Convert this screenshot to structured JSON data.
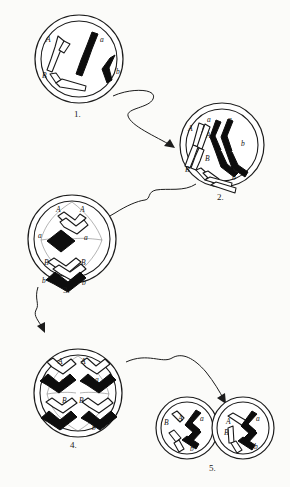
{
  "figure": {
    "background_color": "#fbfbf9",
    "ink_color": "#1a1a1a",
    "maternal_chromosome_color": "#ffffff",
    "paternal_chromosome_color": "#0d0d0d"
  },
  "stages": [
    {
      "caption": "1.",
      "name": "interphase-single-chromosomes",
      "chromosome_labels": [
        "A",
        "a",
        "B",
        "b"
      ],
      "labels": {
        "A": "A",
        "a": "a",
        "B": "B",
        "b": "b"
      }
    },
    {
      "caption": "2.",
      "name": "prophase-duplicated-chromosomes",
      "chromosome_labels": [
        "A",
        "a",
        "a",
        "A",
        "B",
        "B",
        "b",
        "b"
      ],
      "labels": {
        "A_left": "A",
        "A_mid": "A",
        "a_top_left": "a",
        "a_top_right": "a",
        "B_left": "B",
        "B_mid": "B",
        "b_right": "b",
        "b_low": "b"
      }
    },
    {
      "caption": "3.",
      "name": "metaphase-alignment",
      "chromosome_labels": [
        "A",
        "A",
        "a",
        "a",
        "B",
        "B",
        "b",
        "b"
      ],
      "labels": {
        "A_left": "A",
        "A_right": "A",
        "a_left": "a",
        "a_right": "a",
        "B_left": "B",
        "B_right": "B",
        "b_left": "b",
        "b_right": "b"
      }
    },
    {
      "caption": "4.",
      "name": "anaphase-separation",
      "chromosome_labels": [
        "A",
        "A",
        "a",
        "a",
        "B",
        "B",
        "b",
        "b"
      ],
      "labels": {
        "A_left": "A",
        "A_right": "A",
        "a_left": "a",
        "a_right": "a",
        "B_left": "B",
        "B_right": "B",
        "b_left": "b",
        "b_right": "b"
      }
    },
    {
      "caption": "5.",
      "name": "telophase-two-daughter-cells",
      "daughter_cells": [
        {
          "name": "left-daughter-cell",
          "labels": [
            "B",
            "A",
            "a",
            "b"
          ]
        },
        {
          "name": "right-daughter-cell",
          "labels": [
            "A",
            "B",
            "a",
            "b"
          ]
        }
      ],
      "labels": {
        "left_B": "B",
        "left_A": "A",
        "left_a": "a",
        "left_b": "b",
        "right_A": "A",
        "right_B": "B",
        "right_a": "a",
        "right_b": "b"
      }
    }
  ],
  "arrows": [
    {
      "name": "arrow-stage1-to-stage2",
      "from": "1.",
      "to": "2."
    },
    {
      "name": "arrow-stage2-to-stage3",
      "from": "2.",
      "to": "3."
    },
    {
      "name": "arrow-stage3-to-stage4",
      "from": "3.",
      "to": "4."
    },
    {
      "name": "arrow-stage4-to-stage5",
      "from": "4.",
      "to": "5."
    }
  ]
}
